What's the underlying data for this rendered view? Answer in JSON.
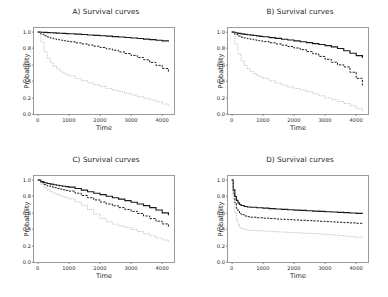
{
  "figure": {
    "background": "#ffffff",
    "layout": "2x2 grid of survival-curve panels"
  },
  "axes": {
    "xlabel": "Time",
    "ylabel": "Probability",
    "xticks": [
      "0",
      "1000",
      "2000",
      "3000",
      "4000"
    ],
    "xtick_values": [
      0,
      1000,
      2000,
      3000,
      4000
    ],
    "yticks": [
      "0.0",
      "0.2",
      "0.4",
      "0.6",
      "0.8",
      "1.0"
    ],
    "ytick_values": [
      0.0,
      0.2,
      0.4,
      0.6,
      0.8,
      1.0
    ],
    "xlim": [
      -120,
      4380
    ],
    "ylim": [
      0.0,
      1.05
    ]
  },
  "style": {
    "line_solid_color": "#1a1a1a",
    "line_dashed_color": "#1a1a1a",
    "line_dotted_color": "#a8a8a8",
    "frame_color": "#9a9a9a"
  },
  "chart_data": [
    {
      "type": "line",
      "title": "A) Survival curves",
      "xlabel": "Time",
      "ylabel": "Probability",
      "xlim": [
        -120,
        4380
      ],
      "ylim": [
        0.0,
        1.05
      ],
      "grid": false,
      "legend": "none",
      "x": [
        0,
        100,
        200,
        300,
        400,
        500,
        600,
        700,
        800,
        900,
        1000,
        1200,
        1400,
        1600,
        1800,
        2000,
        2200,
        2400,
        2600,
        2800,
        3000,
        3200,
        3400,
        3600,
        3800,
        4000,
        4200
      ],
      "series": [
        {
          "name": "solid",
          "style": "solid",
          "values": [
            1.0,
            0.998,
            0.996,
            0.994,
            0.992,
            0.99,
            0.988,
            0.986,
            0.984,
            0.982,
            0.98,
            0.975,
            0.97,
            0.965,
            0.96,
            0.955,
            0.95,
            0.945,
            0.94,
            0.934,
            0.928,
            0.922,
            0.915,
            0.908,
            0.9,
            0.893,
            0.885
          ]
        },
        {
          "name": "dashed",
          "style": "dashed",
          "values": [
            1.0,
            0.975,
            0.955,
            0.94,
            0.928,
            0.918,
            0.91,
            0.902,
            0.895,
            0.888,
            0.882,
            0.868,
            0.855,
            0.842,
            0.828,
            0.812,
            0.795,
            0.778,
            0.758,
            0.738,
            0.715,
            0.69,
            0.662,
            0.63,
            0.594,
            0.556,
            0.515
          ]
        },
        {
          "name": "dotted",
          "style": "dotted",
          "values": [
            1.0,
            0.88,
            0.76,
            0.68,
            0.625,
            0.585,
            0.552,
            0.525,
            0.502,
            0.482,
            0.465,
            0.435,
            0.408,
            0.382,
            0.358,
            0.335,
            0.312,
            0.292,
            0.272,
            0.252,
            0.232,
            0.212,
            0.192,
            0.172,
            0.15,
            0.122,
            0.092
          ]
        }
      ]
    },
    {
      "type": "line",
      "title": "B) Survival curves",
      "xlabel": "Time",
      "ylabel": "Probability",
      "xlim": [
        -120,
        4380
      ],
      "ylim": [
        0.0,
        1.05
      ],
      "grid": false,
      "legend": "none",
      "x": [
        0,
        100,
        200,
        300,
        400,
        500,
        600,
        700,
        800,
        900,
        1000,
        1200,
        1400,
        1600,
        1800,
        2000,
        2200,
        2400,
        2600,
        2800,
        3000,
        3200,
        3400,
        3600,
        3800,
        4000,
        4200
      ],
      "series": [
        {
          "name": "solid",
          "style": "solid",
          "values": [
            1.0,
            0.992,
            0.985,
            0.979,
            0.973,
            0.968,
            0.963,
            0.958,
            0.953,
            0.948,
            0.943,
            0.933,
            0.923,
            0.913,
            0.903,
            0.893,
            0.882,
            0.871,
            0.86,
            0.848,
            0.835,
            0.82,
            0.8,
            0.772,
            0.742,
            0.712,
            0.685
          ]
        },
        {
          "name": "dashed",
          "style": "dashed",
          "values": [
            1.0,
            0.972,
            0.952,
            0.938,
            0.928,
            0.92,
            0.912,
            0.905,
            0.898,
            0.891,
            0.884,
            0.87,
            0.855,
            0.84,
            0.824,
            0.806,
            0.786,
            0.762,
            0.735,
            0.703,
            0.668,
            0.632,
            0.6,
            0.575,
            0.51,
            0.435,
            0.35
          ]
        },
        {
          "name": "dotted",
          "style": "dotted",
          "values": [
            1.0,
            0.855,
            0.73,
            0.648,
            0.592,
            0.552,
            0.52,
            0.495,
            0.472,
            0.452,
            0.435,
            0.405,
            0.378,
            0.352,
            0.33,
            0.312,
            0.295,
            0.272,
            0.248,
            0.222,
            0.198,
            0.175,
            0.152,
            0.128,
            0.1,
            0.065,
            0.03
          ]
        }
      ]
    },
    {
      "type": "line",
      "title": "C) Survival curves",
      "xlabel": "Time",
      "ylabel": "Probability",
      "xlim": [
        -120,
        4380
      ],
      "ylim": [
        0.0,
        1.05
      ],
      "grid": false,
      "legend": "none",
      "x": [
        0,
        100,
        200,
        300,
        400,
        500,
        600,
        700,
        800,
        900,
        1000,
        1200,
        1400,
        1600,
        1800,
        2000,
        2200,
        2400,
        2600,
        2800,
        3000,
        3200,
        3400,
        3600,
        3800,
        4000,
        4200
      ],
      "series": [
        {
          "name": "solid",
          "style": "solid",
          "values": [
            1.0,
            0.982,
            0.968,
            0.958,
            0.95,
            0.943,
            0.937,
            0.931,
            0.925,
            0.92,
            0.915,
            0.898,
            0.878,
            0.858,
            0.84,
            0.822,
            0.803,
            0.785,
            0.768,
            0.75,
            0.73,
            0.708,
            0.688,
            0.663,
            0.635,
            0.6,
            0.572
          ]
        },
        {
          "name": "dashed",
          "style": "dashed",
          "values": [
            1.0,
            0.968,
            0.945,
            0.93,
            0.918,
            0.908,
            0.898,
            0.89,
            0.882,
            0.874,
            0.866,
            0.84,
            0.812,
            0.785,
            0.758,
            0.732,
            0.708,
            0.686,
            0.664,
            0.642,
            0.618,
            0.592,
            0.562,
            0.53,
            0.498,
            0.465,
            0.432
          ]
        },
        {
          "name": "dotted",
          "style": "dotted",
          "values": [
            1.0,
            0.948,
            0.908,
            0.88,
            0.858,
            0.84,
            0.824,
            0.81,
            0.796,
            0.783,
            0.77,
            0.735,
            0.692,
            0.64,
            0.585,
            0.53,
            0.49,
            0.462,
            0.44,
            0.42,
            0.398,
            0.372,
            0.345,
            0.318,
            0.292,
            0.268,
            0.24
          ]
        }
      ]
    },
    {
      "type": "line",
      "title": "D) Survival curves",
      "xlabel": "Time",
      "ylabel": "Probability",
      "xlim": [
        -120,
        4380
      ],
      "ylim": [
        0.0,
        1.05
      ],
      "grid": false,
      "legend": "none",
      "x": [
        0,
        50,
        100,
        150,
        200,
        250,
        300,
        400,
        500,
        600,
        800,
        1000,
        1200,
        1400,
        1600,
        1800,
        2000,
        2200,
        2400,
        2600,
        2800,
        3000,
        3200,
        3400,
        3600,
        3800,
        4000,
        4200
      ],
      "series": [
        {
          "name": "solid",
          "style": "solid",
          "values": [
            1.0,
            0.88,
            0.8,
            0.752,
            0.722,
            0.702,
            0.69,
            0.678,
            0.672,
            0.668,
            0.662,
            0.657,
            0.652,
            0.647,
            0.642,
            0.638,
            0.634,
            0.63,
            0.626,
            0.622,
            0.618,
            0.614,
            0.61,
            0.606,
            0.602,
            0.598,
            0.594,
            0.59
          ]
        },
        {
          "name": "dashed",
          "style": "dashed",
          "values": [
            1.0,
            0.835,
            0.72,
            0.655,
            0.618,
            0.594,
            0.578,
            0.562,
            0.553,
            0.547,
            0.54,
            0.535,
            0.53,
            0.525,
            0.521,
            0.517,
            0.513,
            0.509,
            0.505,
            0.501,
            0.497,
            0.493,
            0.489,
            0.485,
            0.481,
            0.477,
            0.473,
            0.468
          ]
        },
        {
          "name": "dotted",
          "style": "dotted",
          "values": [
            1.0,
            0.76,
            0.6,
            0.51,
            0.458,
            0.428,
            0.41,
            0.396,
            0.39,
            0.386,
            0.381,
            0.377,
            0.373,
            0.369,
            0.365,
            0.361,
            0.357,
            0.353,
            0.349,
            0.345,
            0.341,
            0.336,
            0.33,
            0.323,
            0.316,
            0.309,
            0.302,
            0.296
          ]
        }
      ]
    }
  ]
}
